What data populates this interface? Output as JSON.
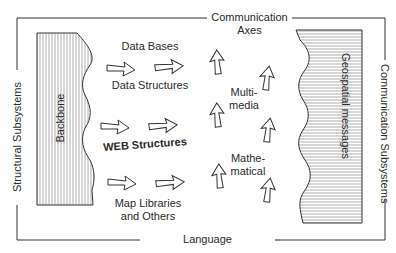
{
  "frame": {
    "top_label_line1": "Communication",
    "top_label_line2": "Axes",
    "bottom_label": "Language",
    "left_label": "Structural Subsystems",
    "right_label": "Communication Subsystems"
  },
  "blocks": {
    "left": {
      "label": "Backbone",
      "hatch": "vertical"
    },
    "right": {
      "label": "Geospatial messages",
      "hatch": "horizontal"
    }
  },
  "structures": [
    {
      "label_above": "Data Bases",
      "label_below": "Data Structures"
    },
    {
      "label_below": "WEB Structures"
    },
    {
      "label_below_line1": "Map Libraries",
      "label_below_line2": "and Others"
    }
  ],
  "media": [
    {
      "line1": "Multi-",
      "line2": "media"
    },
    {
      "line1": "Mathe-",
      "line2": "matical"
    }
  ],
  "colors": {
    "line": "#333333",
    "hatch": "#777777",
    "background": "#ffffff"
  }
}
